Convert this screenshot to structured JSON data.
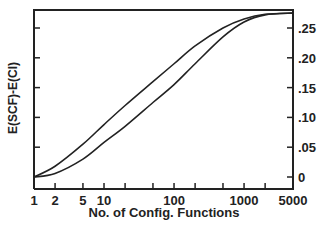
{
  "chart_data": {
    "type": "line",
    "title": "",
    "xlabel": "No. of Config. Functions",
    "ylabel": "E(SCF)-E(CI)",
    "xscale": "log",
    "xlim": [
      1,
      5000
    ],
    "ylim": [
      -0.02,
      0.28
    ],
    "x_tick_labels": [
      "1",
      "2",
      "5",
      "10",
      "100",
      "1000",
      "5000"
    ],
    "x_tick_values": [
      1,
      2,
      5,
      10,
      20,
      50,
      100,
      200,
      500,
      1000,
      2000,
      5000
    ],
    "y_tick_labels": [
      "0",
      ".05",
      ".10",
      ".15",
      ".20",
      ".25"
    ],
    "y_tick_values": [
      0,
      0.05,
      0.1,
      0.15,
      0.2,
      0.25
    ],
    "y_axis_side": "right",
    "grid": false,
    "legend": null,
    "series": [
      {
        "name": "upper curve",
        "x": [
          1,
          2,
          5,
          10,
          20,
          50,
          100,
          200,
          500,
          1000,
          2000,
          5000
        ],
        "y": [
          0.0,
          0.018,
          0.055,
          0.088,
          0.12,
          0.16,
          0.19,
          0.22,
          0.25,
          0.265,
          0.273,
          0.275
        ]
      },
      {
        "name": "lower curve",
        "x": [
          1,
          2,
          5,
          10,
          20,
          50,
          100,
          200,
          500,
          1000,
          2000,
          5000
        ],
        "y": [
          0.0,
          0.006,
          0.03,
          0.058,
          0.085,
          0.125,
          0.155,
          0.19,
          0.235,
          0.26,
          0.272,
          0.275
        ]
      }
    ]
  },
  "colors": {
    "line": "#222222",
    "axis": "#222222",
    "background": "#ffffff"
  }
}
